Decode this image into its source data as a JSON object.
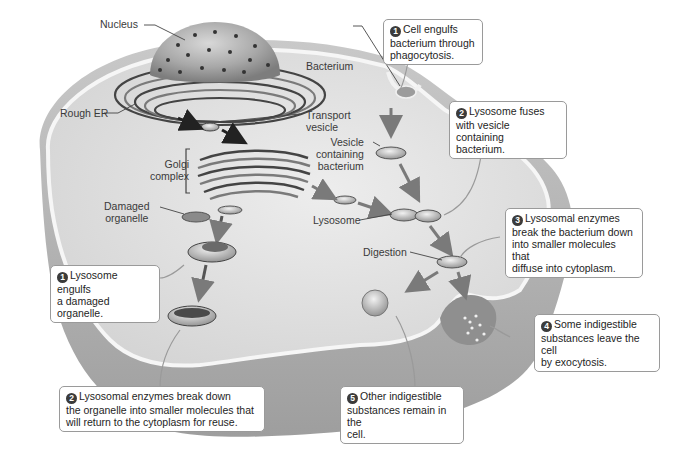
{
  "figure": {
    "structure_labels": {
      "nucleus": "Nucleus",
      "rough_er": "Rough ER",
      "golgi": "Golgi\ncomplex",
      "damaged_organelle": "Damaged\norganelle",
      "bacterium": "Bacterium",
      "transport_vesicle": "Transport\nvesicle",
      "vesicle_containing_bacterium": "Vesicle\ncontaining\nbacterium",
      "lysosome": "Lysosome",
      "digestion": "Digestion"
    },
    "left_pathway": {
      "name": "Autophagy of damaged organelle",
      "steps": [
        {
          "number": "1",
          "text": "Lysosome engulfs\na damaged organelle."
        },
        {
          "number": "2",
          "text": "Lysosomal enzymes break down\nthe organelle into smaller molecules that\nwill return to the cytoplasm for reuse."
        }
      ]
    },
    "right_pathway": {
      "name": "Phagocytosis of bacterium",
      "steps": [
        {
          "number": "1",
          "text": "Cell engulfs\nbacterium through\nphagocytosis."
        },
        {
          "number": "2",
          "text": "Lysosome fuses\nwith vesicle containing\nbacterium."
        },
        {
          "number": "3",
          "text": "Lysosomal enzymes\nbreak the bacterium down\ninto smaller molecules that\ndiffuse into cytoplasm."
        },
        {
          "number": "4",
          "text": "Some indigestible\nsubstances leave the cell\nby exocytosis."
        },
        {
          "number": "5",
          "text": "Other indigestible\nsubstances remain in the\ncell."
        }
      ]
    },
    "colors": {
      "cell_fill": "#d9d9d9",
      "cell_top": "#e6e6e6",
      "cell_side": "#bdbdbd",
      "membrane": "#f4f4f4",
      "nucleus": "#a9a9a9",
      "organelle_dark": "#4a4a4a",
      "arrow": "#7a7a7a",
      "callout_border": "#9a9a9a",
      "step_badge": "#3b3b3b"
    }
  }
}
